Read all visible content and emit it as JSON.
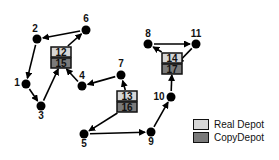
{
  "diagram": {
    "colors": {
      "real_depot": "#d6d6d6",
      "copy_depot": "#7a7a7a",
      "node": "#000000",
      "edge": "#000000"
    },
    "nodes": [
      {
        "id": "1",
        "x": 26,
        "y": 84
      },
      {
        "id": "2",
        "x": 37,
        "y": 39
      },
      {
        "id": "3",
        "x": 41,
        "y": 106
      },
      {
        "id": "4",
        "x": 82,
        "y": 86
      },
      {
        "id": "5",
        "x": 84,
        "y": 134
      },
      {
        "id": "6",
        "x": 86,
        "y": 30
      },
      {
        "id": "7",
        "x": 121,
        "y": 75
      },
      {
        "id": "8",
        "x": 148,
        "y": 44
      },
      {
        "id": "9",
        "x": 151,
        "y": 132
      },
      {
        "id": "10",
        "x": 171,
        "y": 97
      },
      {
        "id": "11",
        "x": 196,
        "y": 44
      }
    ],
    "depots": [
      {
        "real": "12",
        "copy": "15",
        "x": 51,
        "y": 47
      },
      {
        "real": "13",
        "copy": "16",
        "x": 117,
        "y": 91
      },
      {
        "real": "14",
        "copy": "17",
        "x": 162,
        "y": 53
      }
    ],
    "edges": [
      [
        "12",
        "6"
      ],
      [
        "6",
        "2"
      ],
      [
        "2",
        "1"
      ],
      [
        "1",
        "3"
      ],
      [
        "3",
        "15"
      ],
      [
        "4",
        "15"
      ],
      [
        "7",
        "4"
      ],
      [
        "13",
        "7"
      ],
      [
        "16",
        "5"
      ],
      [
        "5",
        "9"
      ],
      [
        "9",
        "10"
      ],
      [
        "10",
        "17"
      ],
      [
        "14",
        "8"
      ],
      [
        "8",
        "11"
      ],
      [
        "11",
        "17"
      ]
    ]
  },
  "legend": {
    "items": [
      {
        "label": "Real Depot",
        "color": "#d6d6d6"
      },
      {
        "label": "CopyDepot",
        "color": "#7a7a7a"
      }
    ]
  }
}
